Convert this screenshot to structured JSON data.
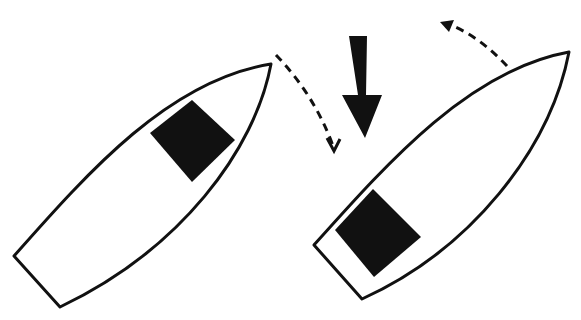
{
  "diagram": {
    "type": "illustration",
    "description": "Two boats viewed from above; a large solid arrow pushes downward between them and dashed curved arrows indicate rotation of each bow",
    "colors": {
      "stroke": "#111111",
      "fill": "#ffffff",
      "block": "#111111"
    },
    "boats": [
      {
        "id": "boat-left",
        "label": ""
      },
      {
        "id": "boat-right",
        "label": ""
      }
    ],
    "arrows": [
      {
        "id": "force-arrow",
        "style": "solid",
        "direction": "down"
      },
      {
        "id": "rotation-arrow-left",
        "style": "dashed",
        "direction": "clockwise-down"
      },
      {
        "id": "rotation-arrow-right",
        "style": "dashed",
        "direction": "counterclockwise-up"
      }
    ]
  }
}
